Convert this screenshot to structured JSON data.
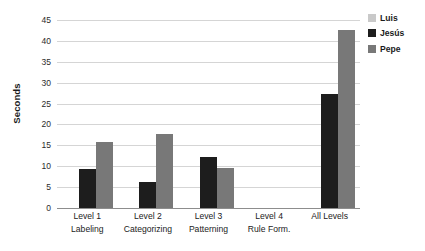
{
  "chart_data": {
    "type": "bar",
    "title": "",
    "xlabel": "",
    "ylabel": "Seconds",
    "ylim": [
      0,
      45
    ],
    "ytick_step": 5,
    "yticks": [
      45,
      40,
      35,
      30,
      25,
      20,
      15,
      10,
      5,
      0
    ],
    "grid": true,
    "legend_position": "top-right",
    "categories": [
      "Level 1 Labeling",
      "Level 2 Categorizing",
      "Level 3 Patterning",
      "Level 4 Rule Form.",
      "All Levels"
    ],
    "category_lines": [
      {
        "line1": "Level 1",
        "line2": "Labeling"
      },
      {
        "line1": "Level 2",
        "line2": "Categorizing"
      },
      {
        "line1": "Level 3",
        "line2": "Patterning"
      },
      {
        "line1": "Level 4",
        "line2": "Rule Form."
      },
      {
        "line1": "All Levels",
        "line2": ""
      }
    ],
    "series": [
      {
        "name": "Luis",
        "color": "#c9c9c9",
        "values": [
          null,
          null,
          null,
          null,
          null
        ]
      },
      {
        "name": "Jesús",
        "color": "#1d1d1d",
        "values": [
          9.3,
          6.2,
          12.3,
          null,
          27.4
        ]
      },
      {
        "name": "Pepe",
        "color": "#787878",
        "values": [
          15.7,
          17.8,
          9.6,
          null,
          42.6
        ]
      }
    ]
  },
  "legend": {
    "items": [
      {
        "label": "Luis",
        "color": "#c9c9c9",
        "swatch_class": "luis"
      },
      {
        "label": "Jesús",
        "color": "#1d1d1d",
        "swatch_class": "jesus"
      },
      {
        "label": "Pepe",
        "color": "#787878",
        "swatch_class": "pepe"
      }
    ]
  },
  "axis": {
    "y_title": "Seconds",
    "y_labels": [
      "45",
      "40",
      "35",
      "30",
      "25",
      "20",
      "15",
      "10",
      "5",
      "0"
    ]
  },
  "colors": {
    "gridline": "#d5d5d5",
    "baseline": "#8d8d8d",
    "text": "#1b1b1b",
    "background": "#ffffff"
  }
}
